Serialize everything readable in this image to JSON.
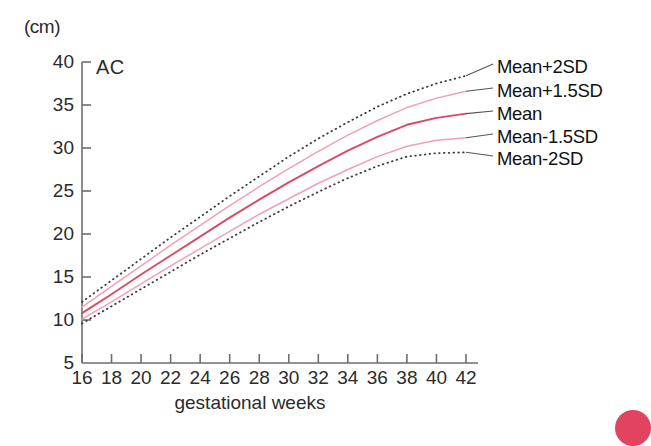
{
  "chart_data": {
    "type": "line",
    "title": "AC",
    "unit_label": "(cm)",
    "xlabel": "gestational weeks",
    "ylabel": "",
    "xlim": [
      16,
      42
    ],
    "ylim": [
      5,
      40
    ],
    "grid": false,
    "legend_position": "right",
    "x_ticks": [
      16,
      18,
      20,
      22,
      24,
      26,
      28,
      30,
      32,
      34,
      36,
      38,
      40,
      42
    ],
    "y_ticks": [
      5,
      10,
      15,
      20,
      25,
      30,
      35,
      40
    ],
    "x": [
      16,
      18,
      20,
      22,
      24,
      26,
      28,
      30,
      32,
      34,
      36,
      38,
      40,
      42
    ],
    "series": [
      {
        "name": "Mean+2SD",
        "style": "dotted",
        "color": "#3a3a3a",
        "values": [
          12.1,
          14.6,
          17.1,
          19.6,
          22.0,
          24.4,
          26.7,
          29.0,
          31.1,
          33.0,
          34.8,
          36.3,
          37.5,
          38.4
        ]
      },
      {
        "name": "Mean+1.5SD",
        "style": "solid",
        "color": "#f0a0b4",
        "values": [
          11.5,
          13.9,
          16.3,
          18.7,
          21.0,
          23.3,
          25.5,
          27.6,
          29.6,
          31.5,
          33.2,
          34.7,
          35.8,
          36.6
        ]
      },
      {
        "name": "Mean",
        "style": "solid",
        "color": "#d94a64",
        "values": [
          10.8,
          13.0,
          15.3,
          17.5,
          19.7,
          21.9,
          24.0,
          26.0,
          27.9,
          29.7,
          31.3,
          32.7,
          33.5,
          34.0
        ]
      },
      {
        "name": "Mean-1.5SD",
        "style": "solid",
        "color": "#f0a0b4",
        "values": [
          10.1,
          12.1,
          14.2,
          16.3,
          18.3,
          20.3,
          22.3,
          24.1,
          25.9,
          27.5,
          29.0,
          30.2,
          30.9,
          31.2
        ]
      },
      {
        "name": "Mean-2SD",
        "style": "dotted",
        "color": "#3a3a3a",
        "values": [
          9.6,
          11.6,
          13.6,
          15.6,
          17.6,
          19.5,
          21.4,
          23.2,
          24.9,
          26.5,
          27.9,
          29.0,
          29.4,
          29.5
        ]
      }
    ],
    "legend_entries": [
      {
        "label": "Mean+2SD"
      },
      {
        "label": "Mean+1.5SD"
      },
      {
        "label": "Mean"
      },
      {
        "label": "Mean-1.5SD"
      },
      {
        "label": "Mean-2SD"
      }
    ]
  }
}
